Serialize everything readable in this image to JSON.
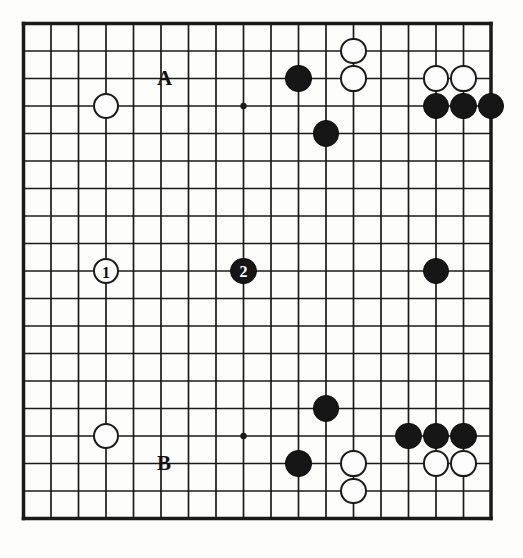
{
  "diagram": {
    "board_type": "go-board",
    "colors": {
      "line": "#1a1a1a",
      "board_background": "#fdfdfb",
      "black_stone": "#161616",
      "white_stone": "#fdfdfd",
      "stone_outline": "#1a1a1a"
    },
    "geometry": {
      "origin_x": 23.5,
      "origin_y": 23.5,
      "spacing": 27.5,
      "columns": 18,
      "rows": 19,
      "stone_radius": 13.2,
      "border_width": 3.5
    },
    "star_points": [
      {
        "col": 9,
        "row": 4
      },
      {
        "col": 9,
        "row": 16
      }
    ],
    "stones": [
      {
        "color": "white",
        "col": 4,
        "row": 4,
        "label": ""
      },
      {
        "color": "black",
        "col": 11,
        "row": 3,
        "label": ""
      },
      {
        "color": "white",
        "col": 13,
        "row": 2,
        "label": ""
      },
      {
        "color": "white",
        "col": 13,
        "row": 3,
        "label": ""
      },
      {
        "color": "white",
        "col": 16,
        "row": 3,
        "label": ""
      },
      {
        "color": "white",
        "col": 17,
        "row": 3,
        "label": ""
      },
      {
        "color": "black",
        "col": 16,
        "row": 4,
        "label": ""
      },
      {
        "color": "black",
        "col": 17,
        "row": 4,
        "label": ""
      },
      {
        "color": "black",
        "col": 18,
        "row": 4,
        "label": ""
      },
      {
        "color": "black",
        "col": 12,
        "row": 5,
        "label": ""
      },
      {
        "color": "white",
        "col": 4,
        "row": 10,
        "label": "1"
      },
      {
        "color": "black",
        "col": 9,
        "row": 10,
        "label": "2"
      },
      {
        "color": "black",
        "col": 16,
        "row": 10,
        "label": ""
      },
      {
        "color": "black",
        "col": 12,
        "row": 15,
        "label": ""
      },
      {
        "color": "white",
        "col": 4,
        "row": 16,
        "label": ""
      },
      {
        "color": "black",
        "col": 15,
        "row": 16,
        "label": ""
      },
      {
        "color": "black",
        "col": 16,
        "row": 16,
        "label": ""
      },
      {
        "color": "black",
        "col": 17,
        "row": 16,
        "label": ""
      },
      {
        "color": "black",
        "col": 11,
        "row": 17,
        "label": ""
      },
      {
        "color": "white",
        "col": 13,
        "row": 17,
        "label": ""
      },
      {
        "color": "white",
        "col": 16,
        "row": 17,
        "label": ""
      },
      {
        "color": "white",
        "col": 17,
        "row": 17,
        "label": ""
      },
      {
        "color": "white",
        "col": 13,
        "row": 18,
        "label": ""
      }
    ],
    "point_markers": [
      {
        "text": "A",
        "col": 6,
        "row": 3,
        "dx": -4,
        "dy": -11
      },
      {
        "text": "B",
        "col": 6,
        "row": 17,
        "dx": -4,
        "dy": -11
      }
    ],
    "move_numbers": {
      "move_1_label": "1",
      "move_1_color": "white",
      "move_2_label": "2",
      "move_2_color": "black"
    }
  }
}
